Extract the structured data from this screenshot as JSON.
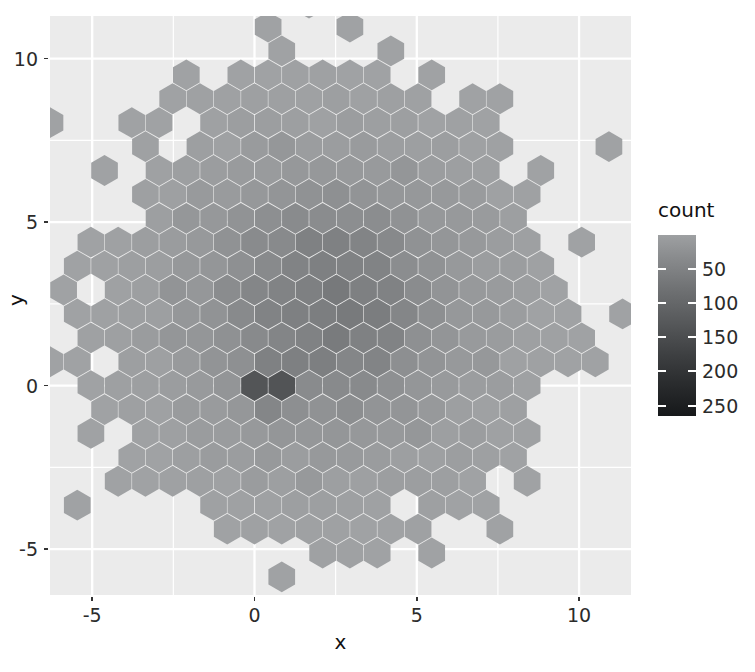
{
  "chart_data": {
    "type": "heatmap",
    "subtype": "hexbin",
    "title": "",
    "xlabel": "x",
    "ylabel": "y",
    "xlim": [
      -6.3,
      11.6
    ],
    "ylim": [
      -6.4,
      11.3
    ],
    "grid": true,
    "panel_background": "#ebebeb",
    "grid_color": "#ffffff",
    "legend": {
      "title": "count",
      "position": "right",
      "type": "continuous-colorbar",
      "ticks": [
        50,
        100,
        150,
        200,
        250
      ],
      "range": [
        1,
        265
      ],
      "low_color": "#a0a2a4",
      "high_color": "#16181a"
    },
    "x_ticks": [
      -5,
      0,
      5,
      10
    ],
    "y_ticks": [
      -5,
      0,
      5,
      10
    ],
    "x_tick_labels": [
      "-5",
      "0",
      "5",
      "10"
    ],
    "y_tick_labels": [
      "-5",
      "0",
      "5",
      "10"
    ],
    "hex_size_data_units": 0.42,
    "clusters": [
      {
        "name": "broad-cloud",
        "center_x": 2.2,
        "center_y": 2.4,
        "sd": 2.6,
        "peak_count": 60
      },
      {
        "name": "dense-core",
        "center_x": 0.4,
        "center_y": 0.0,
        "sd": 0.32,
        "peak_count": 265
      }
    ],
    "count_levels": [
      {
        "count": 1,
        "color": "#a0a2a4"
      },
      {
        "count": 50,
        "color": "#7f8183"
      },
      {
        "count": 100,
        "color": "#636567"
      },
      {
        "count": 150,
        "color": "#494b4d"
      },
      {
        "count": 200,
        "color": "#2f3133"
      },
      {
        "count": 250,
        "color": "#1a1c1e"
      }
    ]
  },
  "axes": {
    "x_title": "x",
    "y_title": "y",
    "x_labels": [
      "-5",
      "0",
      "5",
      "10"
    ],
    "y_labels": [
      "10",
      "5",
      "0",
      "-5"
    ]
  },
  "legend": {
    "title": "count",
    "labels": [
      "50",
      "100",
      "150",
      "200",
      "250"
    ]
  },
  "clipped_title": ""
}
